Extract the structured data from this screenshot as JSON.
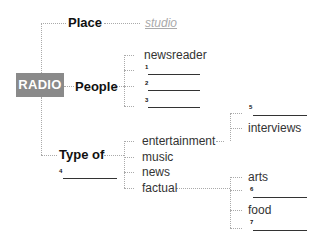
{
  "diagram": {
    "root": {
      "label": "RADIO",
      "color": "#8a8a8a"
    },
    "branches": [
      {
        "label": "Place",
        "children": [
          {
            "label": "studio",
            "style": "example-answer"
          }
        ]
      },
      {
        "label": "People",
        "children": [
          {
            "label": "newsreader"
          },
          {
            "number": "1",
            "label": ""
          },
          {
            "number": "2",
            "label": ""
          },
          {
            "number": "3",
            "label": ""
          }
        ]
      },
      {
        "label": "Type of",
        "blank_number": "4",
        "children": [
          {
            "label": "entertainment",
            "children": [
              {
                "number": "5",
                "label": ""
              },
              {
                "label": "interviews"
              }
            ]
          },
          {
            "label": "music"
          },
          {
            "label": "news"
          },
          {
            "label": "factual",
            "children": [
              {
                "label": "arts"
              },
              {
                "number": "6",
                "label": ""
              },
              {
                "label": "food"
              },
              {
                "number": "7",
                "label": ""
              }
            ]
          }
        ]
      }
    ]
  }
}
